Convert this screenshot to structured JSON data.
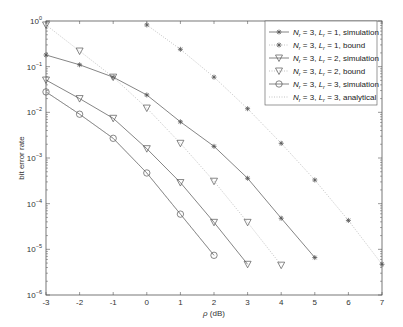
{
  "chart_data": {
    "type": "line",
    "title": "",
    "xlabel": "ρ (dB)",
    "ylabel": "bit error rate",
    "xlim": [
      -3,
      7
    ],
    "ylim": [
      1e-06,
      1
    ],
    "yscale": "log",
    "grid": false,
    "legend_position": "upper right",
    "x_ticks": [
      "-3",
      "-2",
      "-1",
      "0",
      "1",
      "2",
      "3",
      "4",
      "5",
      "6",
      "7"
    ],
    "y_ticks": [
      "10^0",
      "10^-1",
      "10^-2",
      "10^-3",
      "10^-4",
      "10^-5",
      "10^-6"
    ],
    "series": [
      {
        "name": "N_r = 3, L_r = 1, simulation",
        "line": "solid",
        "marker": "asterisk",
        "x": [
          -3,
          -2,
          -1,
          0,
          1,
          2,
          3,
          4,
          5
        ],
        "values": [
          0.18,
          0.11,
          0.059,
          0.024,
          0.0062,
          0.0018,
          0.00036,
          4.8e-05,
          6.6e-06
        ]
      },
      {
        "name": "N_r = 3, L_r = 1, bound",
        "line": "dotted",
        "marker": "asterisk",
        "x": [
          0,
          1,
          2,
          3,
          4,
          5,
          6,
          7
        ],
        "values": [
          0.82,
          0.24,
          0.059,
          0.012,
          0.0021,
          0.00033,
          4.3e-05,
          4.7e-06
        ]
      },
      {
        "name": "N_r = 3, L_r = 2, simulation",
        "line": "solid",
        "marker": "triangle-down",
        "x": [
          -3,
          -2,
          -1,
          0,
          1,
          2,
          3
        ],
        "values": [
          0.051,
          0.02,
          0.0074,
          0.0016,
          0.00029,
          3.9e-05,
          4.7e-06
        ]
      },
      {
        "name": "N_r = 3, L_r = 2, bound",
        "line": "dotted",
        "marker": "triangle-down",
        "x": [
          -3,
          -2,
          -1,
          0,
          1,
          2,
          3,
          4
        ],
        "values": [
          0.82,
          0.22,
          0.059,
          0.0124,
          0.0021,
          0.00031,
          3.9e-05,
          4.5e-06
        ]
      },
      {
        "name": "N_r = 3, L_r = 3, simulation",
        "line": "solid",
        "marker": "circle",
        "x": [
          -3,
          -2,
          -1,
          0,
          1,
          2
        ],
        "values": [
          0.028,
          0.0091,
          0.0027,
          0.00047,
          5.9e-05,
          7.4e-06
        ]
      },
      {
        "name": "N_r = 3, L_r = 3, analytical",
        "line": "dotted",
        "marker": "none",
        "x": [
          -3,
          -2,
          -1,
          0,
          1,
          2
        ],
        "values": [
          0.028,
          0.0091,
          0.0027,
          0.00047,
          5.9e-05,
          7.4e-06
        ]
      }
    ]
  },
  "axes": {
    "xlabel_rho": "ρ",
    "xlabel_unit": " (dB)",
    "ylabel": "bit error rate"
  },
  "legend": {
    "items": [
      {
        "nr": "N",
        "nr_sub": "r",
        "nr_val": " = 3, ",
        "l": "L",
        "l_sub": "r",
        "rest": " = 1, simulation"
      },
      {
        "nr": "N",
        "nr_sub": "r",
        "nr_val": " = 3, ",
        "l": "L",
        "l_sub": "r",
        "rest": " = 1, bound"
      },
      {
        "nr": "N",
        "nr_sub": "r",
        "nr_val": " = 3, ",
        "l": "L",
        "l_sub": "r",
        "rest": " = 2, simulation"
      },
      {
        "nr": "N",
        "nr_sub": "r",
        "nr_val": " = 3, ",
        "l": "L",
        "l_sub": "r",
        "rest": " = 2, bound"
      },
      {
        "nr": "N",
        "nr_sub": "r",
        "nr_val": " = 3, ",
        "l": "L",
        "l_sub": "r",
        "rest": " = 3, simulation"
      },
      {
        "nr": "N",
        "nr_sub": "r",
        "nr_val": " = 3, ",
        "l": "L",
        "l_sub": "r",
        "rest": " = 3, analytical"
      }
    ]
  },
  "colors": {
    "axis": "#555555",
    "solid_line": "#777777",
    "dotted_line": "#aaaaaa",
    "marker": "#555555"
  }
}
